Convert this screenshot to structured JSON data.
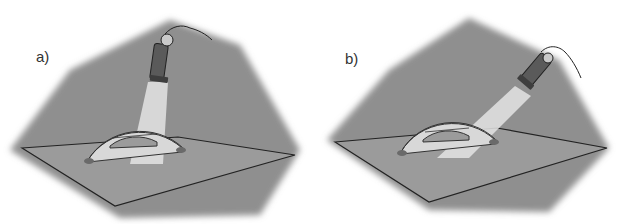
{
  "panels": [
    {
      "id": "a",
      "label": "a)",
      "description": "Flashlight held vertically above protractor, beam shining straight down",
      "protractor_ticks": {
        "left": "180",
        "center": "90",
        "right": "0",
        "mid": "22.5"
      }
    },
    {
      "id": "b",
      "label": "b)",
      "description": "Flashlight held at an angle, beam shining obliquely across protractor",
      "protractor_ticks": {
        "left": "180",
        "center": "90",
        "right": "0",
        "mid": "22.5"
      }
    }
  ],
  "colors": {
    "background": "#ffffff",
    "shadow": "#8f8f8f",
    "paper": "#9a9a9a",
    "outline": "#222222",
    "protractor": "#d9d9d9",
    "beam": "#e6e6e6",
    "flashlight": "#5a5a5a"
  }
}
